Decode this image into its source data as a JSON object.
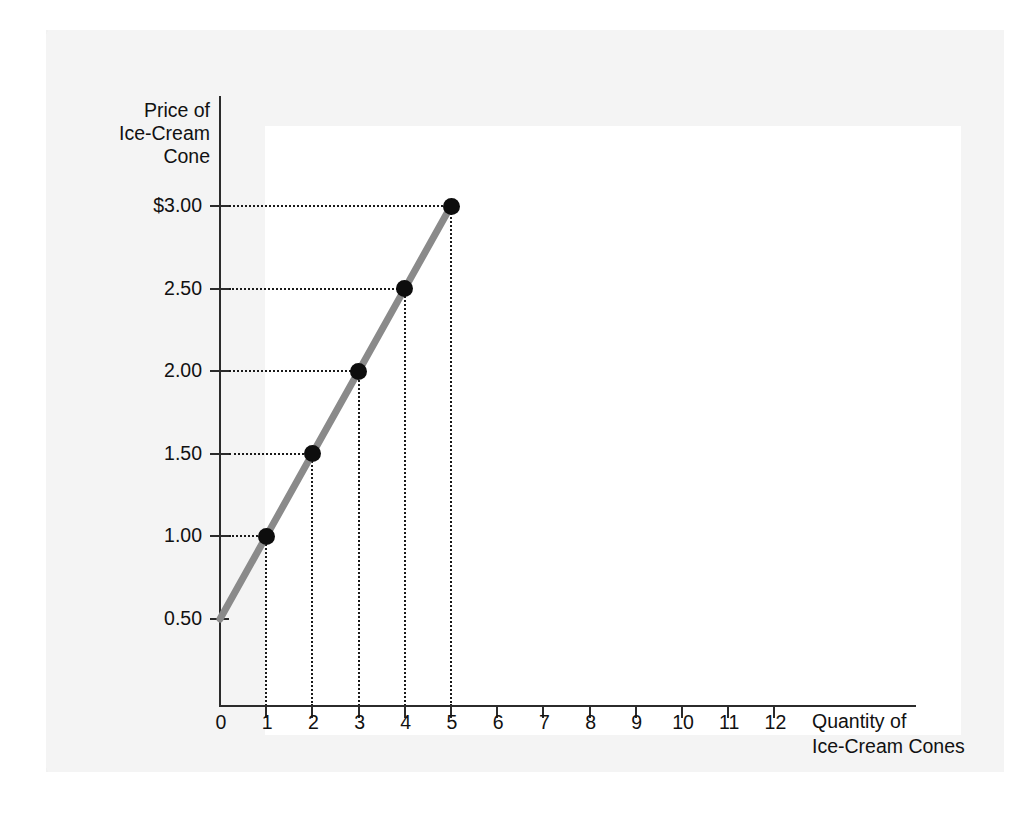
{
  "figure": {
    "caption_fragment": "l",
    "line_color": "#8a8a8a",
    "point_color": "#0d0d0d",
    "axis_color": "#2b2b2b",
    "panel_color": "#f4f4f4",
    "plot_background": "#ffffff"
  },
  "y_axis": {
    "title_lines": [
      "Price of",
      "Ice-Cream",
      "Cone"
    ],
    "title": "Price of Ice-Cream Cone",
    "ticks": [
      {
        "label": "$3.00",
        "value": 3.0
      },
      {
        "label": "2.50",
        "value": 2.5
      },
      {
        "label": "2.00",
        "value": 2.0
      },
      {
        "label": "1.50",
        "value": 1.5
      },
      {
        "label": "1.00",
        "value": 1.0
      },
      {
        "label": "0.50",
        "value": 0.5
      }
    ]
  },
  "x_axis": {
    "title_lines": [
      "Quantity of",
      "Ice-Cream Cones"
    ],
    "title": "Quantity of Ice-Cream Cones",
    "ticks": [
      {
        "label": "0",
        "value": 0
      },
      {
        "label": "1",
        "value": 1
      },
      {
        "label": "2",
        "value": 2
      },
      {
        "label": "3",
        "value": 3
      },
      {
        "label": "4",
        "value": 4
      },
      {
        "label": "5",
        "value": 5
      },
      {
        "label": "6",
        "value": 6
      },
      {
        "label": "7",
        "value": 7
      },
      {
        "label": "8",
        "value": 8
      },
      {
        "label": "9",
        "value": 9
      },
      {
        "label": "10",
        "value": 10
      },
      {
        "label": "11",
        "value": 11
      },
      {
        "label": "12",
        "value": 12
      }
    ]
  },
  "chart_data": {
    "type": "line",
    "title": "",
    "xlabel": "Quantity of Ice-Cream Cones",
    "ylabel": "Price of Ice-Cream Cone",
    "xlim": [
      0,
      12
    ],
    "ylim": [
      0.5,
      3.0
    ],
    "grid": false,
    "legend": "none",
    "xticks": [
      0,
      1,
      2,
      3,
      4,
      5,
      6,
      7,
      8,
      9,
      10,
      11,
      12
    ],
    "xticklabels": [
      "0",
      "1",
      "2",
      "3",
      "4",
      "5",
      "6",
      "7",
      "8",
      "9",
      "10",
      "11",
      "12"
    ],
    "yticks": [
      0.5,
      1.0,
      1.5,
      2.0,
      2.5,
      3.0
    ],
    "yticklabels": [
      "0.50",
      "1.00",
      "1.50",
      "2.00",
      "2.50",
      "$3.00"
    ],
    "series": [
      {
        "name": "Supply curve",
        "x": [
          0,
          1,
          2,
          3,
          4,
          5
        ],
        "y": [
          0.5,
          1.0,
          1.5,
          2.0,
          2.5,
          3.0
        ],
        "line_color": "#8a8a8a",
        "line_width": 7,
        "markers": [
          {
            "x": 1,
            "y": 1.0,
            "label": "1.00"
          },
          {
            "x": 2,
            "y": 1.5,
            "label": "1.50"
          },
          {
            "x": 3,
            "y": 2.0,
            "label": "2.00"
          },
          {
            "x": 4,
            "y": 2.5,
            "label": "2.50"
          },
          {
            "x": 5,
            "y": 3.0,
            "label": "$3.00"
          }
        ]
      }
    ],
    "annotations": [
      {
        "type": "dotted-guides",
        "description": "Dotted horizontal lines from each y tick to its data point and dotted vertical lines from each data point down to its x tick."
      }
    ]
  }
}
